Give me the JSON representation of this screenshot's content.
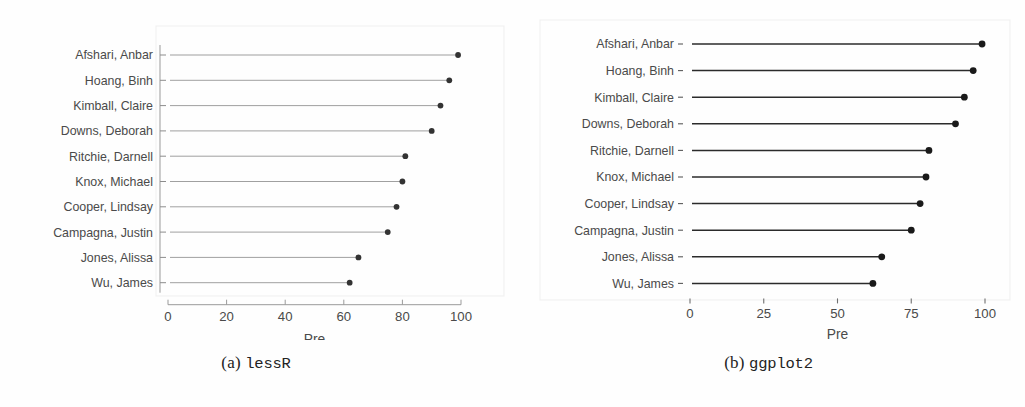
{
  "figure": {
    "panels": [
      {
        "id": "lessR",
        "caption_prefix": "(a)",
        "caption_name": "lessR",
        "chart_data": {
          "type": "bar",
          "orientation": "horizontal",
          "style": "lollipop-dot-plot",
          "title": "",
          "xlabel": "Pre",
          "ylabel": "",
          "xlim": [
            0,
            100
          ],
          "xticks": [
            0,
            20,
            40,
            60,
            80,
            100
          ],
          "xtick_labels": [
            "0",
            "20",
            "40",
            "60",
            "80",
            "100"
          ],
          "grid": false,
          "axis_line": true,
          "tick_marks": true,
          "categories": [
            "Afshari, Anbar",
            "Hoang, Binh",
            "Kimball, Claire",
            "Downs, Deborah",
            "Ritchie, Darnell",
            "Knox, Michael",
            "Cooper, Lindsay",
            "Campagna, Justin",
            "Jones, Alissa",
            "Wu, James"
          ],
          "values": [
            99,
            96,
            93,
            90,
            81,
            80,
            78,
            75,
            65,
            62
          ],
          "point_color": "#333333",
          "line_color": "#8f8f8f"
        }
      },
      {
        "id": "ggplot2",
        "caption_prefix": "(b)",
        "caption_name": "ggplot2",
        "chart_data": {
          "type": "bar",
          "orientation": "horizontal",
          "style": "lollipop-dot-plot",
          "title": "",
          "xlabel": "Pre",
          "ylabel": "",
          "xlim": [
            0,
            100
          ],
          "xticks": [
            0,
            25,
            50,
            75,
            100
          ],
          "xtick_labels": [
            "0",
            "25",
            "50",
            "75",
            "100"
          ],
          "grid": false,
          "axis_line": false,
          "tick_marks": true,
          "categories": [
            "Afshari, Anbar",
            "Hoang, Binh",
            "Kimball, Claire",
            "Downs, Deborah",
            "Ritchie, Darnell",
            "Knox, Michael",
            "Cooper, Lindsay",
            "Campagna, Justin",
            "Jones, Alissa",
            "Wu, James"
          ],
          "values": [
            99,
            96,
            93,
            90,
            81,
            80,
            78,
            75,
            65,
            62
          ],
          "point_color": "#1a1a1a",
          "line_color": "#2b2b2b"
        }
      }
    ]
  },
  "colors": {
    "background": "#fefefe",
    "text": "#4a4a4a",
    "caption_text": "#232323",
    "axis": "#909090"
  }
}
